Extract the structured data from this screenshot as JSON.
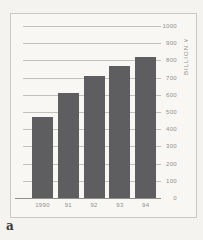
{
  "figure": {
    "label": "a"
  },
  "chart_data": {
    "type": "bar",
    "title": "",
    "categories": [
      "1990",
      "91",
      "92",
      "93",
      "94"
    ],
    "values": [
      470,
      610,
      710,
      765,
      820
    ],
    "xlabel": "",
    "ylabel": "BILLION ¥",
    "ylim": [
      0,
      1000
    ],
    "ytick_step": 100,
    "ytick_labels": [
      "1000",
      "900",
      "800",
      "700",
      "600",
      "500",
      "400",
      "300",
      "200",
      "100",
      "0"
    ],
    "legend": "none",
    "grid": "horizontal",
    "axis_side": "right",
    "colors": {
      "bar": "#5e5e60",
      "gridline": "#c3c1bc",
      "baseline": "#8f8f8b",
      "frame_border": "#cbc9c4",
      "tick_text": "#8f8f8b",
      "page_background": "#f5f3ef",
      "figure_label_text": "#3c3c3a"
    }
  }
}
